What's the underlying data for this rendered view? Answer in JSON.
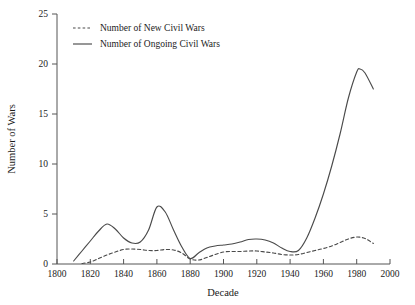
{
  "chart_data": {
    "type": "line",
    "title": "",
    "xlabel": "Decade",
    "ylabel": "Number of Wars",
    "xlim": [
      1800,
      2000
    ],
    "ylim": [
      0,
      25
    ],
    "xticks": [
      1800,
      1820,
      1840,
      1860,
      1880,
      1900,
      1920,
      1940,
      1960,
      1980,
      2000
    ],
    "yticks": [
      0,
      5,
      10,
      15,
      20,
      25
    ],
    "grid": false,
    "legend_position": "top-left-inside",
    "series": [
      {
        "name": "Number of New Civil Wars",
        "style": "dashed",
        "color": "#4a4a4a",
        "x": [
          1815,
          1820,
          1825,
          1830,
          1835,
          1840,
          1845,
          1850,
          1855,
          1860,
          1865,
          1870,
          1875,
          1880,
          1885,
          1890,
          1895,
          1900,
          1905,
          1910,
          1915,
          1920,
          1925,
          1930,
          1935,
          1940,
          1945,
          1950,
          1955,
          1960,
          1965,
          1970,
          1975,
          1980,
          1985,
          1990
        ],
        "values": [
          0.05,
          0.2,
          0.55,
          0.9,
          1.2,
          1.45,
          1.5,
          1.45,
          1.35,
          1.35,
          1.45,
          1.4,
          1.1,
          0.5,
          0.4,
          0.65,
          0.95,
          1.2,
          1.25,
          1.25,
          1.3,
          1.3,
          1.2,
          1.1,
          0.95,
          0.9,
          0.95,
          1.15,
          1.35,
          1.55,
          1.8,
          2.15,
          2.5,
          2.7,
          2.55,
          2.05
        ]
      },
      {
        "name": "Number of Ongoing Civil Wars",
        "style": "solid",
        "color": "#4a4a4a",
        "x": [
          1810,
          1815,
          1820,
          1825,
          1830,
          1835,
          1840,
          1845,
          1850,
          1855,
          1860,
          1865,
          1870,
          1875,
          1880,
          1885,
          1890,
          1895,
          1900,
          1905,
          1910,
          1915,
          1920,
          1925,
          1930,
          1935,
          1940,
          1945,
          1950,
          1955,
          1960,
          1965,
          1970,
          1975,
          1980,
          1982,
          1985,
          1990
        ],
        "values": [
          0.3,
          1.3,
          2.3,
          3.3,
          4.0,
          3.5,
          2.6,
          2.1,
          2.2,
          3.4,
          5.7,
          5.2,
          3.4,
          1.7,
          0.55,
          1.1,
          1.6,
          1.8,
          1.9,
          2.0,
          2.2,
          2.45,
          2.5,
          2.4,
          2.1,
          1.6,
          1.25,
          1.35,
          2.6,
          4.6,
          7.0,
          9.8,
          13.0,
          16.6,
          19.2,
          19.5,
          19.1,
          17.5
        ]
      }
    ]
  },
  "axes": {
    "y_title": "Number of Wars",
    "x_title": "Decade"
  },
  "legend": {
    "items": [
      {
        "label": "Number of New Civil Wars",
        "style": "dashed"
      },
      {
        "label": "Number of Ongoing Civil Wars",
        "style": "solid"
      }
    ]
  }
}
